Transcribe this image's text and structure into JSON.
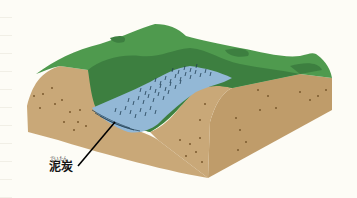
{
  "diagram": {
    "label": {
      "text": "泥炭",
      "reading": "でいたん"
    },
    "colors": {
      "background": "#fdfcf6",
      "grass_light": "#4f9a4e",
      "grass_dark": "#3d7f40",
      "soil_front": "#c9a878",
      "soil_side": "#bf9c6a",
      "soil_dots": "#7a5a2e",
      "water": "#93b8d6",
      "reeds": "#1f3d52",
      "leader_line": "#000000"
    }
  }
}
